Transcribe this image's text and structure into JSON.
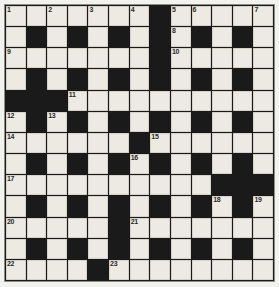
{
  "puzzle": {
    "title": "Crossword Grid",
    "columns": 13,
    "rows": 13,
    "colors": {
      "page_background": "#f2f2ee",
      "block_color": "#1a1a1a",
      "cell_color": "#eceae2",
      "grid_line": "#1a1a1a",
      "frame_border": "#8d8d8a",
      "number_color": "#2a2a28"
    },
    "legend": {
      "white_symbol": ".",
      "block_symbol": "#"
    },
    "pattern": [
      ".......#.....",
      ".#.#.#.#.#.#.",
      ".......#.....",
      ".#.#.#.#.#.#.",
      "###..........",
      ".#.#.#.#.#.#.",
      "......#......",
      ".#.#.#.#.#.#.",
      "..........###",
      ".#.#.#.#.#.#.",
      ".....#.......",
      ".#.#.#.#.#.#.",
      "....#........"
    ],
    "numbers": [
      {
        "label": "1",
        "row": 1,
        "col": 1
      },
      {
        "label": "2",
        "row": 1,
        "col": 3
      },
      {
        "label": "3",
        "row": 1,
        "col": 5
      },
      {
        "label": "4",
        "row": 1,
        "col": 7
      },
      {
        "label": "5",
        "row": 1,
        "col": 9
      },
      {
        "label": "6",
        "row": 1,
        "col": 10
      },
      {
        "label": "7",
        "row": 1,
        "col": 13
      },
      {
        "label": "8",
        "row": 2,
        "col": 9
      },
      {
        "label": "9",
        "row": 3,
        "col": 1
      },
      {
        "label": "10",
        "row": 3,
        "col": 9
      },
      {
        "label": "11",
        "row": 5,
        "col": 4
      },
      {
        "label": "12",
        "row": 6,
        "col": 1
      },
      {
        "label": "13",
        "row": 6,
        "col": 3
      },
      {
        "label": "14",
        "row": 7,
        "col": 1
      },
      {
        "label": "15",
        "row": 7,
        "col": 8
      },
      {
        "label": "16",
        "row": 8,
        "col": 7
      },
      {
        "label": "17",
        "row": 9,
        "col": 1
      },
      {
        "label": "18",
        "row": 10,
        "col": 11
      },
      {
        "label": "19",
        "row": 10,
        "col": 13
      },
      {
        "label": "20",
        "row": 11,
        "col": 1
      },
      {
        "label": "21",
        "row": 11,
        "col": 7
      },
      {
        "label": "22",
        "row": 13,
        "col": 1
      },
      {
        "label": "23",
        "row": 13,
        "col": 6
      }
    ],
    "entries": []
  }
}
